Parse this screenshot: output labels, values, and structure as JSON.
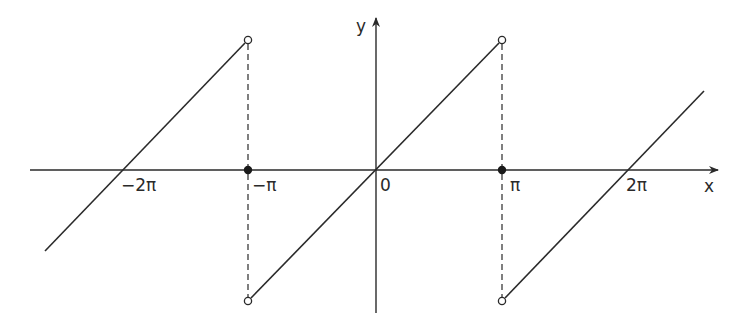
{
  "diagram": {
    "title": "",
    "axes": {
      "x_label": "x",
      "y_label": "y",
      "x_ticks": [
        {
          "label": "−2π",
          "value": "-2pi"
        },
        {
          "label": "−π",
          "value": "-pi"
        },
        {
          "label": "0",
          "value": "0"
        },
        {
          "label": "π",
          "value": "pi"
        },
        {
          "label": "2π",
          "value": "2pi"
        }
      ]
    },
    "function_description": "Sawtooth: f(x) = x on (−π, π), extended periodically with period 2π; f(±π) = 0",
    "segments": [
      {
        "from": "x < −π (left part)",
        "to": "−π (open endpoint at top)",
        "crosses_axis_at": "−2π"
      },
      {
        "from": "−π (open endpoint at bottom)",
        "to": "π (open endpoint at top)",
        "crosses_axis_at": "0"
      },
      {
        "from": "π (open endpoint at bottom)",
        "to": "x > 2π",
        "crosses_axis_at": "2π"
      }
    ],
    "open_points": [
      "(−π, π)",
      "(−π, −π)",
      "(π, π)",
      "(π, −π)"
    ],
    "filled_points": [
      "(−π, 0)",
      "(π, 0)"
    ],
    "colors": {
      "line": "#2a2a2a",
      "background": "#ffffff"
    }
  }
}
